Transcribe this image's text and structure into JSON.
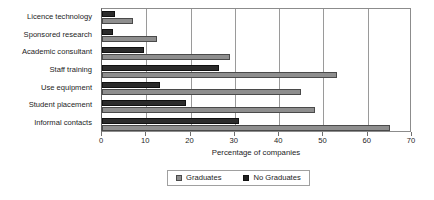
{
  "chart_data": {
    "type": "bar",
    "orientation": "horizontal",
    "title": "",
    "xlabel": "Percentage of companies",
    "ylabel": "",
    "xlim": [
      0,
      70
    ],
    "xticks": [
      0,
      10,
      20,
      30,
      40,
      50,
      60,
      70
    ],
    "grid": true,
    "legend_position": "bottom",
    "categories": [
      "Licence technology",
      "Sponsored research",
      "Academic consultant",
      "Staff training",
      "Use equipment",
      "Student placement",
      "Informal contacts"
    ],
    "series": [
      {
        "name": "No Graduates",
        "color": "#2b2b2b",
        "values": [
          3,
          2.5,
          9.5,
          26.5,
          13,
          19,
          31
        ]
      },
      {
        "name": "Graduates",
        "color": "#8e8e8e",
        "values": [
          7,
          12.5,
          29,
          53,
          45,
          48,
          65
        ]
      }
    ]
  },
  "legend": {
    "items": [
      {
        "label": "Graduates",
        "swatch": "grad"
      },
      {
        "label": "No Graduates",
        "swatch": "nograd"
      }
    ]
  }
}
